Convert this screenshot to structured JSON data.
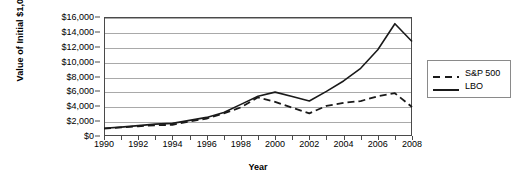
{
  "chart_data": {
    "type": "line",
    "title": "",
    "xlabel": "Year",
    "ylabel": "Value of Initial $1,000",
    "xlim": [
      1990,
      2008
    ],
    "ylim": [
      0,
      16000
    ],
    "grid": true,
    "legend_position": "right",
    "x": [
      1990,
      1991,
      1992,
      1993,
      1994,
      1995,
      1996,
      1997,
      1998,
      1999,
      2000,
      2001,
      2002,
      2003,
      2004,
      2005,
      2006,
      2007,
      2008
    ],
    "xticks": [
      1990,
      1992,
      1994,
      1996,
      1998,
      2000,
      2002,
      2004,
      2006,
      2008
    ],
    "xtick_labels": [
      "1990",
      "1992",
      "1994",
      "1996",
      "1998",
      "2000",
      "2002",
      "2004",
      "2006",
      "2008"
    ],
    "yticks": [
      0,
      2000,
      4000,
      6000,
      8000,
      10000,
      12000,
      14000,
      16000
    ],
    "ytick_labels": [
      "$0",
      "$2,000",
      "$4,000",
      "$6,000",
      "$8,000",
      "$10,000",
      "$12,000",
      "$14,000",
      "$16,000"
    ],
    "series": [
      {
        "name": "S&P 500",
        "style": "dashed",
        "color": "#1a1a1a",
        "values": [
          1000,
          1150,
          1300,
          1450,
          1500,
          1950,
          2350,
          3050,
          3850,
          5200,
          4600,
          3800,
          3050,
          4050,
          4450,
          4700,
          5350,
          5750,
          3900
        ]
      },
      {
        "name": "LBO",
        "style": "solid",
        "color": "#1a1a1a",
        "values": [
          1050,
          1200,
          1400,
          1600,
          1700,
          2100,
          2500,
          3150,
          4250,
          5350,
          5900,
          5300,
          4700,
          6000,
          7400,
          9100,
          11600,
          15100,
          12700
        ]
      }
    ]
  },
  "legend": {
    "items": [
      {
        "label": "S&P 500",
        "style": "dashed"
      },
      {
        "label": "LBO",
        "style": "solid"
      }
    ]
  },
  "axes": {
    "x_title": "Year",
    "y_title": "Value of Initial $1,000"
  },
  "colors": {
    "line": "#1a1a1a",
    "grid": "#a9a9a9",
    "frame": "#4a4a4a",
    "background": "#ffffff"
  }
}
